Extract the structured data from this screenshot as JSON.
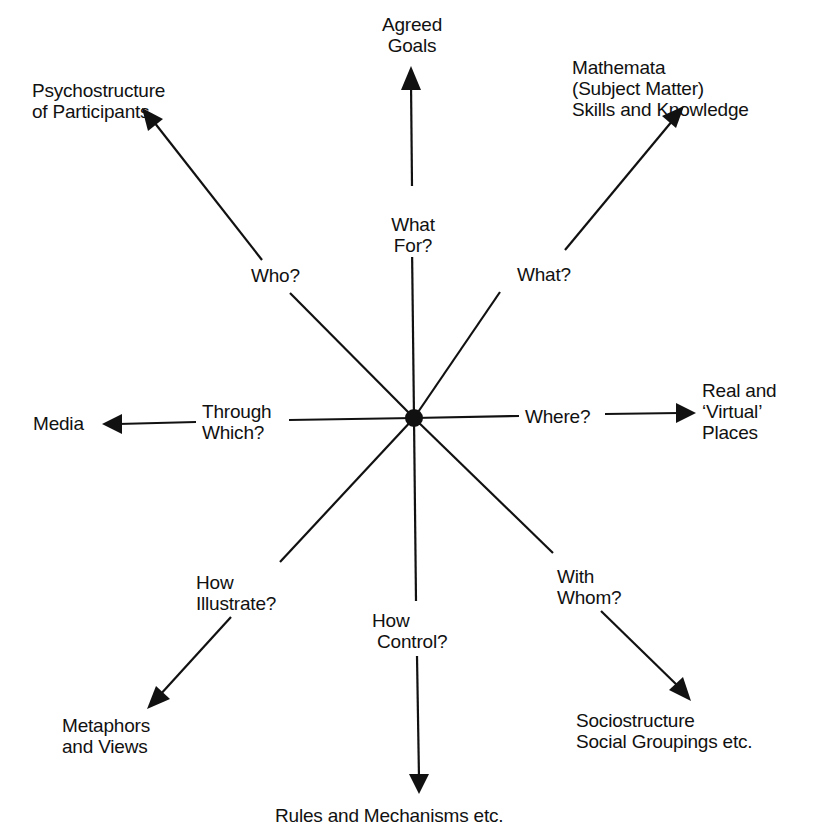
{
  "diagram": {
    "center": {
      "x": 414,
      "y": 418
    },
    "stroke_color": "#111111",
    "background_color": "#ffffff",
    "spokes": [
      {
        "id": "up",
        "question": "What\nFor?",
        "target": "Agreed\nGoals"
      },
      {
        "id": "up-right",
        "question": "What?",
        "target": "Mathemata\n(Subject Matter)\nSkills and Knowledge"
      },
      {
        "id": "right",
        "question": "Where?",
        "target": "Real and\n‘Virtual’\nPlaces"
      },
      {
        "id": "down-right",
        "question": "With\nWhom?",
        "target": "Sociostructure\nSocial Groupings etc."
      },
      {
        "id": "down",
        "question": "How\n Control?",
        "target": "Rules and Mechanisms etc."
      },
      {
        "id": "down-left",
        "question": "How\nIllustrate?",
        "target": "Metaphors\nand Views"
      },
      {
        "id": "left",
        "question": "Through\nWhich?",
        "target": "Media"
      },
      {
        "id": "up-left",
        "question": "Who?",
        "target": "Psychostructure\nof Participants"
      }
    ]
  }
}
